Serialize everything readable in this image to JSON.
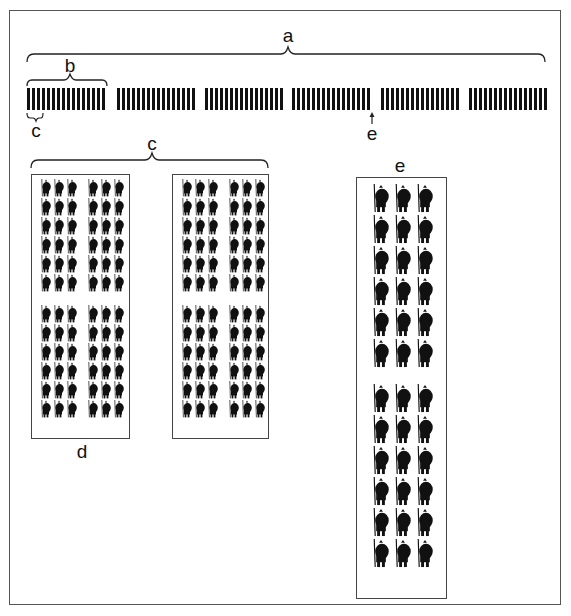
{
  "figure": {
    "labels": {
      "a": "a",
      "b": "b",
      "c_small": "c",
      "e_arrow": "e",
      "c_large": "c",
      "d": "d",
      "e_box": "e"
    },
    "bar_row": {
      "group_count": 6,
      "bars_per_group": 16,
      "bar_color": "#111111"
    },
    "detail_boxes": [
      {
        "id": "d1",
        "column_groups": 2,
        "columns_per_group": 3,
        "rows_per_block": 6,
        "blocks": 2
      },
      {
        "id": "d2",
        "column_groups": 2,
        "columns_per_group": 3,
        "rows_per_block": 6,
        "blocks": 2
      }
    ],
    "e_box": {
      "columns": 3,
      "rows_per_block": 6,
      "blocks": 2
    },
    "colors": {
      "ink": "#111111",
      "frame": "#555555",
      "background": "#ffffff"
    }
  }
}
